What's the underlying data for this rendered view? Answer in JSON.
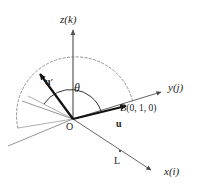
{
  "figure": {
    "type": "vector-rotation-3d-axes",
    "background_color": "#ffffff",
    "axis_color": "#555555",
    "vector_color": "#111111",
    "dashed_arc_color": "#777777",
    "guide_line_color": "#888888",
    "label_color": "#1a1a1a"
  },
  "axes": {
    "z": {
      "label": "z(k)",
      "label_x": 60,
      "label_y": 14
    },
    "y": {
      "label": "y(j)",
      "label_x": 168,
      "label_y": 82
    },
    "x": {
      "label": "x(i)",
      "label_x": 164,
      "label_y": 166
    }
  },
  "vectors": {
    "u": {
      "label": "u",
      "label_x": 116,
      "label_y": 119
    },
    "u_prime": {
      "label": "u",
      "prime": "′",
      "label_x": 45,
      "label_y": 72
    }
  },
  "annotations": {
    "theta": {
      "label": "θ",
      "label_x": 74,
      "label_y": 82
    },
    "origin": {
      "label": "O",
      "label_x": 66,
      "label_y": 122
    },
    "point_b": {
      "label": "B(0, 1, 0)",
      "label_x": 120,
      "label_y": 104
    },
    "line_l": {
      "label": "L",
      "label_x": 114,
      "label_y": 156
    }
  },
  "geometry": {
    "origin": {
      "x": 73,
      "y": 119
    },
    "z_axis_tip": {
      "x": 73,
      "y": 26
    },
    "y_axis_tip": {
      "x": 166,
      "y": 90
    },
    "x_axis_tip": {
      "x": 156,
      "y": 172
    },
    "u_tip": {
      "x": 131,
      "y": 104
    },
    "u_prime_tip": {
      "x": 35,
      "y": 70
    },
    "guide_left_tip": {
      "x": 28,
      "y": 96
    },
    "negative_y_end": {
      "x": 8,
      "y": 146
    },
    "arc_left": {
      "x": 18,
      "y": 128
    },
    "arc_right": {
      "x": 133,
      "y": 103
    },
    "arc_top": {
      "x": 73,
      "y": 57
    }
  }
}
